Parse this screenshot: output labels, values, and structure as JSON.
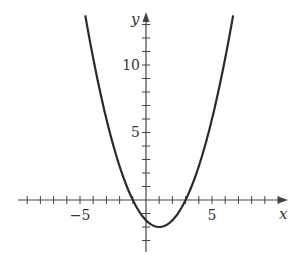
{
  "chart_data": {
    "type": "line",
    "title": "",
    "xlabel": "x",
    "ylabel": "y",
    "function": "y = 0.5(x + 1)(x - 3)",
    "vertex": [
      1,
      -2
    ],
    "x_intercepts": [
      -1,
      3
    ],
    "y_intercept": -1.5,
    "xlim": [
      -9.5,
      10.5
    ],
    "ylim": [
      -4,
      13.5
    ],
    "x_ticks": [
      -9,
      -8,
      -7,
      -6,
      -5,
      -4,
      -3,
      -2,
      -1,
      1,
      2,
      3,
      4,
      5,
      6,
      7,
      8,
      9,
      10
    ],
    "y_ticks": [
      -3,
      -2,
      -1,
      1,
      2,
      3,
      4,
      5,
      6,
      7,
      8,
      9,
      10,
      11,
      12,
      13
    ],
    "x_tick_labels": [
      {
        "value": -5,
        "label": "−5"
      },
      {
        "value": 5,
        "label": "5"
      }
    ],
    "y_tick_labels": [
      {
        "value": 5,
        "label": "5"
      },
      {
        "value": 10,
        "label": "10"
      }
    ],
    "curve_domain": [
      -4.6,
      6.6
    ],
    "grid": false,
    "legend": null
  },
  "labels": {
    "x_axis": "x",
    "y_axis": "y",
    "x_neg5": "−5",
    "x_5": "5",
    "y_5": "5",
    "y_10": "10"
  },
  "colors": {
    "curve": "#2a2a2a",
    "axis": "#444444"
  }
}
